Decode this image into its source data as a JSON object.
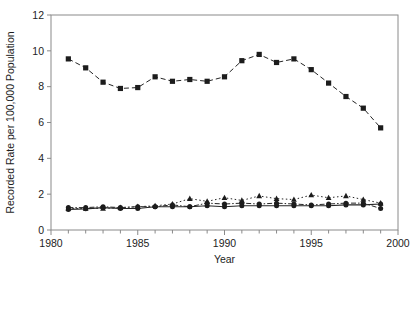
{
  "chart_data": {
    "type": "line",
    "title": "",
    "subtitle": "",
    "xlabel": "Year",
    "ylabel": "Recorded Rate per 100,000 Population",
    "xlim": [
      1980,
      2000
    ],
    "ylim": [
      0,
      12
    ],
    "xticks": [
      1980,
      1985,
      1990,
      1995,
      2000
    ],
    "xtick_labels": [
      "1980",
      "1985",
      "1990",
      "1995",
      "2000"
    ],
    "xminor_tick_step": 1,
    "yticks": [
      0,
      2,
      4,
      6,
      8,
      10,
      12
    ],
    "ytick_labels": [
      "0",
      "2",
      "4",
      "6",
      "8",
      "10",
      "12"
    ],
    "grid": false,
    "legend_position": "bottom",
    "x": [
      1981,
      1982,
      1983,
      1984,
      1985,
      1986,
      1987,
      1988,
      1989,
      1990,
      1991,
      1992,
      1993,
      1994,
      1995,
      1996,
      1997,
      1998,
      1999
    ],
    "series": [
      {
        "name": "England & Wales",
        "marker": "circle",
        "dash": "solid",
        "values": [
          1.15,
          1.18,
          1.25,
          1.2,
          1.2,
          1.3,
          1.3,
          1.3,
          1.35,
          1.3,
          1.35,
          1.35,
          1.35,
          1.35,
          1.35,
          1.35,
          1.4,
          1.4,
          1.45
        ]
      },
      {
        "name": "United States",
        "marker": "square",
        "dash": "dashed",
        "values": [
          9.55,
          9.05,
          8.25,
          7.9,
          7.95,
          8.55,
          8.3,
          8.4,
          8.3,
          8.55,
          9.45,
          9.8,
          9.35,
          9.55,
          8.95,
          8.2,
          7.45,
          6.8,
          5.7
        ]
      },
      {
        "name": "Switzerland",
        "marker": "circle",
        "dash": "dashdot",
        "values": [
          1.25,
          1.25,
          1.3,
          1.25,
          1.3,
          1.3,
          1.4,
          1.3,
          1.5,
          1.45,
          1.5,
          1.45,
          1.5,
          1.45,
          1.4,
          1.45,
          1.5,
          1.5,
          1.2
        ]
      },
      {
        "name": "Netherlands",
        "marker": "triangle",
        "dash": "dotted",
        "values": [
          1.2,
          1.2,
          1.2,
          1.25,
          1.3,
          1.35,
          1.45,
          1.75,
          1.6,
          1.8,
          1.65,
          1.9,
          1.75,
          1.7,
          1.95,
          1.8,
          1.9,
          1.7,
          1.5
        ]
      }
    ],
    "colors": {
      "series": "#1c1c1c",
      "axis": "#8a8a8a",
      "background": "#ffffff"
    }
  },
  "legend": {
    "entries": [
      {
        "label": "England & Wales"
      },
      {
        "label": "United States"
      },
      {
        "label": "Switzerland"
      },
      {
        "label": "Netherlands"
      }
    ]
  }
}
